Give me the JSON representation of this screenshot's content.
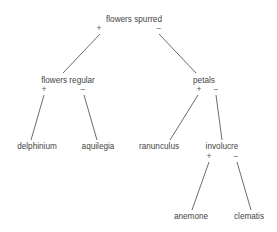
{
  "diagram": {
    "type": "decision-tree",
    "title": "",
    "palette": {
      "background": "#ffffff",
      "text": "#444444",
      "edge": "#5a5a5a"
    },
    "nodes": [
      {
        "id": "flowers-spurred",
        "label": "flowers spurred",
        "kind": "internal",
        "depth": 0,
        "x": 134,
        "y": 22,
        "left_sign": "+",
        "right_sign": "−",
        "left_sign_x": 99,
        "right_sign_x": 159,
        "sign_y": 31
      },
      {
        "id": "flowers-regular",
        "label": "flowers regular",
        "kind": "internal",
        "depth": 1,
        "x": 68,
        "y": 83,
        "left_sign": "+",
        "right_sign": "−",
        "left_sign_x": 44,
        "right_sign_x": 83,
        "sign_y": 92
      },
      {
        "id": "petals",
        "label": "petals",
        "kind": "internal",
        "depth": 1,
        "x": 204,
        "y": 83,
        "left_sign": "+",
        "right_sign": "−",
        "left_sign_x": 199,
        "right_sign_x": 216,
        "sign_y": 92
      },
      {
        "id": "delphinium",
        "label": "delphinium",
        "kind": "leaf",
        "depth": 2,
        "x": 37,
        "y": 149
      },
      {
        "id": "aquilegia",
        "label": "aquilegia",
        "kind": "leaf",
        "depth": 2,
        "x": 98,
        "y": 149
      },
      {
        "id": "ranunculus",
        "label": "ranunculus",
        "kind": "leaf",
        "depth": 2,
        "x": 159,
        "y": 149
      },
      {
        "id": "involucre",
        "label": "involucre",
        "kind": "internal",
        "depth": 2,
        "x": 222,
        "y": 149,
        "left_sign": "+",
        "right_sign": "−",
        "left_sign_x": 209,
        "right_sign_x": 236,
        "sign_y": 159
      },
      {
        "id": "anemone",
        "label": "anemone",
        "kind": "leaf",
        "depth": 3,
        "x": 191,
        "y": 219
      },
      {
        "id": "clematis",
        "label": "clematis",
        "kind": "leaf",
        "depth": 3,
        "x": 249,
        "y": 219
      }
    ],
    "edges": [
      {
        "id": "e-root-left",
        "from": "flowers-spurred",
        "to": "flowers-regular",
        "sign": "+",
        "x1": 100,
        "y1": 34,
        "x2": 63,
        "y2": 73
      },
      {
        "id": "e-root-right",
        "from": "flowers-spurred",
        "to": "petals",
        "sign": "−",
        "x1": 159,
        "y1": 34,
        "x2": 196,
        "y2": 73
      },
      {
        "id": "e-regular-left",
        "from": "flowers-regular",
        "to": "delphinium",
        "sign": "+",
        "x1": 44,
        "y1": 95,
        "x2": 31,
        "y2": 140
      },
      {
        "id": "e-regular-right",
        "from": "flowers-regular",
        "to": "aquilegia",
        "sign": "−",
        "x1": 84,
        "y1": 95,
        "x2": 97,
        "y2": 140
      },
      {
        "id": "e-petals-left",
        "from": "petals",
        "to": "ranunculus",
        "sign": "+",
        "x1": 198,
        "y1": 95,
        "x2": 170,
        "y2": 140
      },
      {
        "id": "e-petals-right",
        "from": "petals",
        "to": "involucre",
        "sign": "−",
        "x1": 216,
        "y1": 95,
        "x2": 222,
        "y2": 140
      },
      {
        "id": "e-involucre-left",
        "from": "involucre",
        "to": "anemone",
        "sign": "+",
        "x1": 209,
        "y1": 162,
        "x2": 192,
        "y2": 210
      },
      {
        "id": "e-involucre-right",
        "from": "involucre",
        "to": "clematis",
        "sign": "−",
        "x1": 237,
        "y1": 162,
        "x2": 251,
        "y2": 210
      }
    ]
  }
}
